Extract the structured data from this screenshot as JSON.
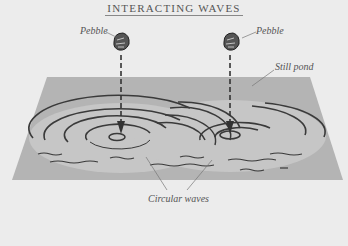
{
  "diagram": {
    "title": "INTERACTING WAVES",
    "labels": {
      "pebble_left": "Pebble",
      "pebble_right": "Pebble",
      "still_pond": "Still pond",
      "circular_waves": "Circular waves"
    },
    "cut_off_caption": "",
    "colors": {
      "background": "#ececec",
      "pond": "#b4b4b4",
      "ripple_area": "#c8c8c8",
      "ink": "#333333",
      "label_text": "#555555"
    },
    "elements": {
      "pebbles": [
        {
          "x": 121,
          "y": 42
        },
        {
          "x": 231,
          "y": 42
        }
      ],
      "arrows": [
        {
          "x": 121,
          "y_start": 55,
          "y_end": 133
        },
        {
          "x": 230,
          "y_start": 55,
          "y_end": 133
        }
      ],
      "pond_polygon": [
        [
          47,
          77
        ],
        [
          310,
          77
        ],
        [
          343,
          180
        ],
        [
          12,
          180
        ]
      ]
    }
  }
}
